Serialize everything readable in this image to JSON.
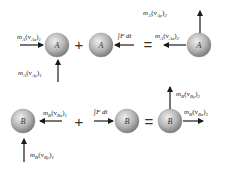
{
  "diagram": {
    "colors": {
      "sphere_light": "#e6e6e6",
      "sphere_dark": "#8a8a8a",
      "arrow": "#1a1a1a"
    },
    "row_a": {
      "ball_label": "A",
      "initial_x_momentum": {
        "m": "m",
        "msub": "A",
        "v": "(v",
        "vsub": "Ax",
        "close": ")",
        "idx": "1"
      },
      "initial_y_momentum": {
        "m": "m",
        "msub": "A",
        "v": "(v",
        "vsub": "Ay",
        "close": ")",
        "idx": "1"
      },
      "impulse": "∫F dt",
      "final_x_momentum": {
        "m": "m",
        "msub": "A",
        "v": "(v",
        "vsub": "Ax",
        "close": ")",
        "idx": "2"
      },
      "final_y_momentum": {
        "m": "m",
        "msub": "A",
        "v": "(v",
        "vsub": "Ay",
        "close": ")",
        "idx": "2"
      },
      "plus": "+",
      "equals": "="
    },
    "row_b": {
      "ball_label": "B",
      "initial_x_momentum": {
        "m": "m",
        "msub": "B",
        "v": "(v",
        "vsub": "Bx",
        "close": ")",
        "idx": "1"
      },
      "initial_y_momentum": {
        "m": "m",
        "msub": "B",
        "v": "(v",
        "vsub": "By",
        "close": ")",
        "idx": "1"
      },
      "impulse": "∫F dt",
      "final_x_momentum": {
        "m": "m",
        "msub": "B",
        "v": "(v",
        "vsub": "Bx",
        "close": ")",
        "idx": "2"
      },
      "final_y_momentum": {
        "m": "m",
        "msub": "B",
        "v": "(v",
        "vsub": "By",
        "close": ")",
        "idx": "2"
      },
      "plus": "+",
      "equals": "="
    }
  }
}
